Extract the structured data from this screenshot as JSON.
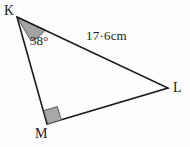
{
  "figure": {
    "kind": "geometry-diagram",
    "shape": "triangle",
    "name": "triangle-KLM",
    "background_color": "#fefefe",
    "stroke_color": "#1a1a1a",
    "stroke_width": 1.6,
    "fill_color": "none",
    "vertices": [
      {
        "id": "K",
        "label": "K",
        "x": 17,
        "y": 17
      },
      {
        "id": "L",
        "label": "L",
        "x": 168,
        "y": 88
      },
      {
        "id": "M",
        "label": "M",
        "x": 47,
        "y": 124
      }
    ],
    "sides": [
      {
        "id": "KL",
        "from": "K",
        "to": "L",
        "label": "17·6cm"
      },
      {
        "id": "LM",
        "from": "L",
        "to": "M",
        "label": ""
      },
      {
        "id": "MK",
        "from": "M",
        "to": "K",
        "label": ""
      }
    ],
    "angles": [
      {
        "id": "K",
        "at": "K",
        "label": "38°",
        "marker": "shaded-sector",
        "fill_color": "#a3a3a3",
        "stroke_color": "#5a5a5a"
      },
      {
        "id": "M",
        "at": "M",
        "label": "",
        "marker": "right-angle-square",
        "fill_color": "#a8a8a8",
        "stroke_color": "#5a5a5a"
      }
    ],
    "labels": {
      "vertex_K": "K",
      "vertex_L": "L",
      "vertex_M": "M",
      "angle_K": "38°",
      "side_KL": "17·6cm"
    }
  }
}
